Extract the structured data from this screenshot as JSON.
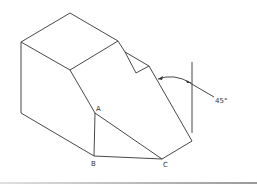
{
  "diagram": {
    "type": "isometric-solid",
    "points": {
      "A": "A",
      "B": "B",
      "C": "C"
    },
    "angle_label": "45°",
    "colors": {
      "line": "#333333",
      "background": "#ffffff"
    }
  }
}
